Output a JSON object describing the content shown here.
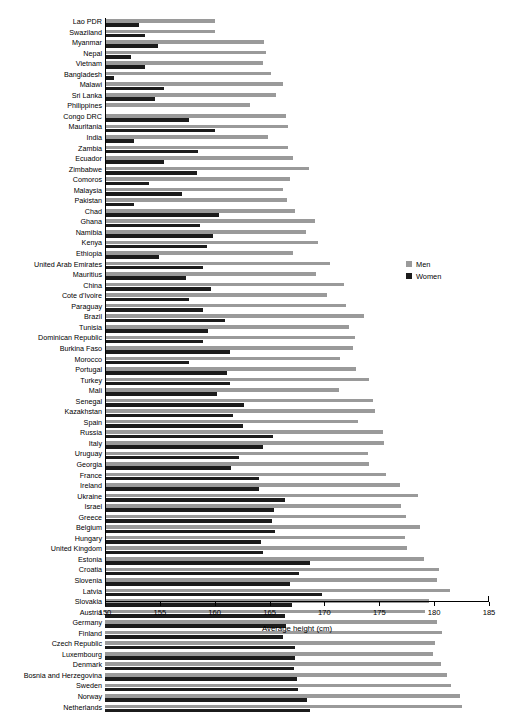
{
  "chart_data": {
    "type": "bar",
    "orientation": "horizontal",
    "title": "",
    "xlabel": "Average height (cm)",
    "ylabel": "",
    "xlim": [
      150,
      185
    ],
    "xticks": [
      150,
      155,
      160,
      165,
      170,
      175,
      180,
      185
    ],
    "grid": false,
    "legend_position": "right-middle",
    "categories": [
      "Lao PDR",
      "Swaziland",
      "Myanmar",
      "Nepal",
      "Vietnam",
      "Bangladesh",
      "Malawi",
      "Sri Lanka",
      "Philippines",
      "Congo DRC",
      "Mauritania",
      "India",
      "Zambia",
      "Ecuador",
      "Zimbabwe",
      "Comoros",
      "Malaysia",
      "Pakistan",
      "Chad",
      "Ghana",
      "Namibia",
      "Kenya",
      "Ethiopia",
      "United Arab Emirates",
      "Mauritius",
      "China",
      "Cote d'Ivoire",
      "Paraguay",
      "Brazil",
      "Tunisia",
      "Dominican Republic",
      "Burkina Faso",
      "Morocco",
      "Portugal",
      "Turkey",
      "Mali",
      "Senegal",
      "Kazakhstan",
      "Spain",
      "Russia",
      "Italy",
      "Uruguay",
      "Georgia",
      "France",
      "Ireland",
      "Ukraine",
      "Israel",
      "Greece",
      "Belgium",
      "Hungary",
      "United Kingdom",
      "Estonia",
      "Croatia",
      "Slovenia",
      "Latvia",
      "Slovakia",
      "Austria",
      "Germany",
      "Finland",
      "Czech Republic",
      "Luxembourg",
      "Denmark",
      "Bosnia and Herzegovina",
      "Sweden",
      "Norway",
      "Netherlands"
    ],
    "series": [
      {
        "name": "Men",
        "color": "#9a9a9a",
        "values": [
          160.0,
          160.0,
          164.5,
          164.7,
          164.4,
          165.1,
          166.2,
          165.6,
          163.2,
          166.5,
          166.7,
          164.9,
          166.7,
          167.1,
          168.6,
          166.9,
          166.2,
          166.6,
          167.3,
          169.1,
          168.3,
          169.4,
          167.1,
          170.5,
          169.2,
          171.8,
          170.2,
          172.0,
          173.6,
          172.2,
          172.8,
          172.6,
          171.4,
          172.9,
          174.1,
          171.3,
          174.4,
          174.6,
          173.1,
          175.3,
          175.4,
          174.0,
          174.1,
          175.6,
          176.9,
          178.5,
          177.0,
          177.4,
          178.7,
          177.3,
          177.5,
          179.1,
          180.4,
          180.3,
          181.4,
          179.5,
          179.2,
          180.3,
          180.7,
          180.1,
          179.9,
          180.6,
          181.2,
          181.5,
          182.4,
          182.5
        ]
      },
      {
        "name": "Women",
        "color": "#1c1c1c",
        "values": [
          153.1,
          153.6,
          154.8,
          152.4,
          153.6,
          150.8,
          155.4,
          154.6,
          149.6,
          157.7,
          160.0,
          152.6,
          158.5,
          155.4,
          158.4,
          154.0,
          157.0,
          152.6,
          160.4,
          158.7,
          159.8,
          159.3,
          154.9,
          158.9,
          157.4,
          159.7,
          157.7,
          158.9,
          160.9,
          159.4,
          158.9,
          161.4,
          157.7,
          161.1,
          161.4,
          160.2,
          162.7,
          161.7,
          162.6,
          165.3,
          164.4,
          162.2,
          161.5,
          164.0,
          164.0,
          166.4,
          165.4,
          165.2,
          165.5,
          164.2,
          164.4,
          168.7,
          167.7,
          166.9,
          169.8,
          167.0,
          166.4,
          166.5,
          166.2,
          167.3,
          167.3,
          167.2,
          167.5,
          167.6,
          168.4,
          168.7
        ]
      }
    ]
  },
  "legend": {
    "items": [
      {
        "label": "Men",
        "color": "#9a9a9a"
      },
      {
        "label": "Women",
        "color": "#1c1c1c"
      }
    ]
  },
  "axis": {
    "xlabel": "Average height (cm)",
    "tick_labels": [
      "150",
      "155",
      "160",
      "165",
      "170",
      "175",
      "180",
      "185"
    ]
  }
}
